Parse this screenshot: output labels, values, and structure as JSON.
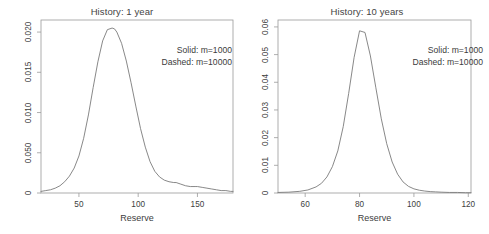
{
  "figure": {
    "background": "#ffffff",
    "line_color": "#7a7a7a",
    "axis_color": "#9a9a9a",
    "text_color": "#3d3d3d"
  },
  "chart_data": [
    {
      "type": "line",
      "id": "history-1-year",
      "title": "History: 1 year",
      "xlabel": "Reserve",
      "ylabel": "",
      "xlim": [
        18,
        180
      ],
      "ylim": [
        0,
        0.0215
      ],
      "grid": false,
      "legend_position": "inside-top-right",
      "annotations": [
        "Solid: m=1000",
        "Dashed: m=10000"
      ],
      "xticks": [
        50,
        100,
        150
      ],
      "xticklabels": [
        "50",
        "100",
        "150"
      ],
      "yticks": [
        0,
        0.005,
        0.01,
        0.015,
        0.02
      ],
      "yticklabels": [
        "0",
        "0.050",
        "0.010",
        "0.015",
        "0.020"
      ],
      "series": [
        {
          "name": "Solid: m=1000",
          "style": "solid",
          "x": [
            18,
            22,
            26,
            30,
            34,
            38,
            42,
            46,
            50,
            54,
            58,
            62,
            66,
            70,
            74,
            78,
            80,
            82,
            86,
            90,
            94,
            98,
            102,
            106,
            110,
            114,
            118,
            122,
            126,
            130,
            132,
            136,
            140,
            144,
            148,
            150,
            154,
            158,
            162,
            166,
            170,
            174,
            178,
            180
          ],
          "y": [
            0.0002,
            0.0003,
            0.0004,
            0.0006,
            0.0009,
            0.0014,
            0.0021,
            0.0031,
            0.0046,
            0.0068,
            0.0097,
            0.0131,
            0.0163,
            0.0189,
            0.0203,
            0.0205,
            0.0204,
            0.02,
            0.0186,
            0.0164,
            0.0137,
            0.0108,
            0.008,
            0.0057,
            0.0039,
            0.0027,
            0.002,
            0.0016,
            0.0014,
            0.0013,
            0.0013,
            0.0011,
            0.0009,
            0.0008,
            0.0008,
            0.0008,
            0.0007,
            0.0006,
            0.0005,
            0.0004,
            0.0003,
            0.0003,
            0.0002,
            0.0002
          ]
        }
      ]
    },
    {
      "type": "line",
      "id": "history-10-years",
      "title": "History: 10 years",
      "xlabel": "Reserve",
      "ylabel": "",
      "xlim": [
        50,
        121
      ],
      "ylim": [
        0,
        0.0625
      ],
      "grid": false,
      "legend_position": "inside-top-right",
      "annotations": [
        "Solid: m=1000",
        "Dashed: m=10000"
      ],
      "xticks": [
        60,
        80,
        100,
        120
      ],
      "xticklabels": [
        "60",
        "80",
        "100",
        "120"
      ],
      "yticks": [
        0,
        0.01,
        0.02,
        0.03,
        0.04,
        0.05,
        0.06
      ],
      "yticklabels": [
        "0",
        "0.01",
        "0.02",
        "0.03",
        "0.04",
        "0.05",
        "0.06"
      ],
      "series": [
        {
          "name": "Solid: m=1000",
          "style": "solid",
          "x": [
            50,
            54,
            58,
            61,
            64,
            66,
            68,
            70,
            72,
            74,
            76,
            78,
            80,
            82,
            84,
            86,
            88,
            90,
            92,
            94,
            96,
            98,
            100,
            102,
            104,
            106,
            108,
            110,
            113,
            116,
            119,
            121
          ],
          "y": [
            0.0002,
            0.0003,
            0.0006,
            0.0011,
            0.0022,
            0.0035,
            0.0058,
            0.0095,
            0.0152,
            0.024,
            0.036,
            0.049,
            0.0586,
            0.058,
            0.0495,
            0.038,
            0.0268,
            0.0178,
            0.0112,
            0.0068,
            0.004,
            0.0024,
            0.0015,
            0.001,
            0.0007,
            0.0005,
            0.0004,
            0.0003,
            0.0002,
            0.0002,
            0.0001,
            0.0001
          ]
        }
      ]
    }
  ]
}
